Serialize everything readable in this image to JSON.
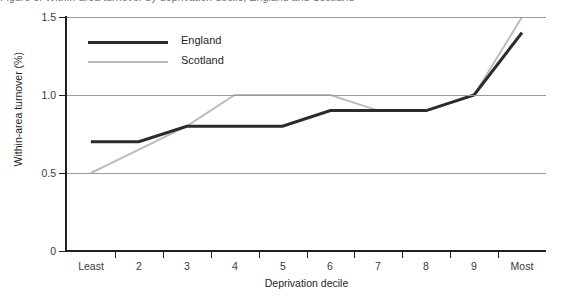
{
  "figure": {
    "caption": "Figure 5: Within-area turnover by deprivation decile, England and Scotland"
  },
  "chart_data": {
    "type": "line",
    "title": "",
    "xlabel": "Deprivation decile",
    "ylabel": "Within-area turnover (%)",
    "categories": [
      "Least",
      "2",
      "3",
      "4",
      "5",
      "6",
      "7",
      "8",
      "9",
      "Most"
    ],
    "ylim": [
      0,
      1.5
    ],
    "yticks": [
      0,
      0.5,
      1.0,
      1.5
    ],
    "ytick_labels": [
      "0",
      "0.5",
      "1.0",
      "1.5"
    ],
    "grid": "horizontal",
    "legend_position": "top-left",
    "series": [
      {
        "name": "England",
        "color": "#2b2b2b",
        "width": 3,
        "values": [
          0.7,
          0.7,
          0.8,
          0.8,
          0.8,
          0.9,
          0.9,
          0.9,
          1.0,
          1.4
        ]
      },
      {
        "name": "Scotland",
        "color": "#bcbcbc",
        "width": 2,
        "values": [
          0.5,
          0.65,
          0.8,
          1.0,
          1.0,
          1.0,
          0.9,
          0.9,
          1.0,
          1.5
        ]
      }
    ]
  },
  "colors": {
    "england": "#2b2b2b",
    "scotland": "#bcbcbc",
    "axis": "#231f20",
    "grid": "#9a9a9a",
    "background": "#ffffff"
  }
}
